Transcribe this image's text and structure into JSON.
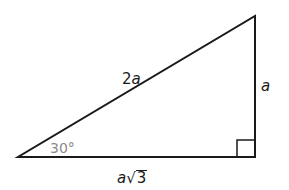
{
  "figure": {
    "type": "right-triangle",
    "vertices": {
      "bottom_left": [
        18,
        157
      ],
      "bottom_right": [
        255,
        157
      ],
      "top_right": [
        255,
        16
      ]
    },
    "right_angle_marker": {
      "corner": "bottom_right",
      "size": 18
    },
    "colors": {
      "stroke": "#1a1a1a",
      "angle_label": "#8a8a8a",
      "background": "#ffffff"
    }
  },
  "labels": {
    "hypotenuse": {
      "coef": "2",
      "var": "a"
    },
    "vertical_leg": {
      "var": "a"
    },
    "horizontal_leg": {
      "var": "a",
      "radicand": "3",
      "radical": "√"
    },
    "angle": "30°"
  }
}
